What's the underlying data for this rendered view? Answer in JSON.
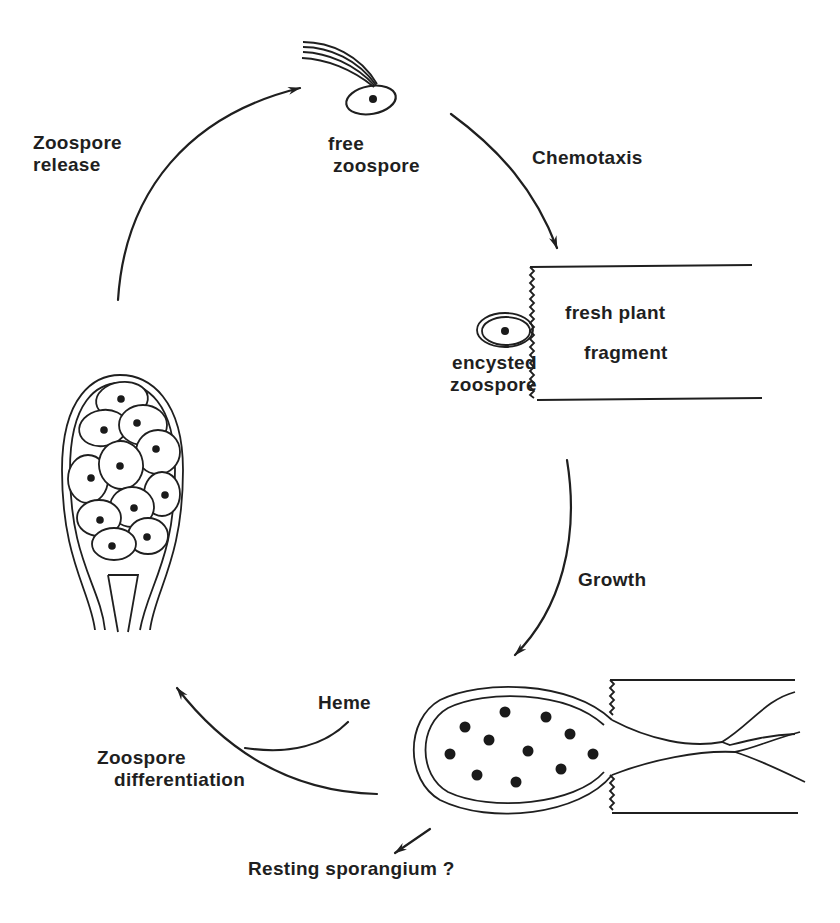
{
  "diagram": {
    "stages": [
      {
        "id": "free-zoospore",
        "label_line1": "free",
        "label_line2": "zoospore"
      },
      {
        "id": "encysted-zoospore",
        "label_line1": "encysted",
        "label_line2": "zoospore"
      },
      {
        "id": "plant-fragment",
        "label_line1": "fresh plant",
        "label_line2": "fragment"
      },
      {
        "id": "zoosporangium",
        "label_line1": "",
        "label_line2": ""
      },
      {
        "id": "resting-sporangium",
        "label_line1": "Resting sporangium ?",
        "label_line2": ""
      }
    ],
    "transitions": [
      {
        "id": "chemotaxis",
        "label_line1": "Chemotaxis",
        "label_line2": ""
      },
      {
        "id": "growth",
        "label_line1": "Growth",
        "label_line2": ""
      },
      {
        "id": "zoospore-differentiation",
        "label_line1": "Zoospore",
        "label_line2": "differentiation"
      },
      {
        "id": "heme",
        "label_line1": "Heme",
        "label_line2": ""
      },
      {
        "id": "zoospore-release",
        "label_line1": "Zoospore",
        "label_line2": "release"
      }
    ],
    "colors": {
      "ink": "#1f1f1f",
      "background": "#ffffff"
    }
  }
}
